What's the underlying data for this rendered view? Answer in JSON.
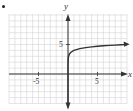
{
  "chart_data": {
    "type": "line",
    "title": "",
    "xlabel": "x",
    "ylabel": "y",
    "xlim": [
      -10,
      10
    ],
    "ylim": [
      -5,
      10
    ],
    "grid": true,
    "grid_step": 1,
    "x_tick_labels": [
      "-5",
      "5"
    ],
    "y_tick_labels": [
      "5"
    ],
    "function": "y = log(x) + 4",
    "series": [
      {
        "name": "f(x)",
        "x": [
          0.0002,
          0.001,
          0.01,
          0.05,
          0.1,
          0.25,
          0.5,
          1,
          2,
          3,
          4,
          5,
          6,
          7,
          8,
          9,
          9.6
        ],
        "y": [
          0.3,
          1.0,
          2.0,
          2.7,
          3.0,
          3.4,
          3.7,
          4.0,
          4.3,
          4.48,
          4.6,
          4.7,
          4.78,
          4.85,
          4.9,
          4.95,
          4.98
        ]
      }
    ],
    "colors": {
      "curve": "#333333",
      "axes": "#333333",
      "grid": "#d4d4d4"
    }
  },
  "labels": {
    "x_axis": "x",
    "y_axis": "y",
    "tick_neg5": "-5",
    "tick_pos5": "5",
    "tick_y5": "5"
  }
}
